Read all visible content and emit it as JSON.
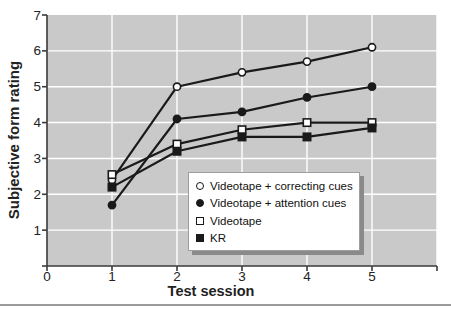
{
  "chart_data": {
    "type": "line",
    "title": "",
    "xlabel": "Test session",
    "ylabel": "Subjective form rating",
    "x": [
      1,
      2,
      3,
      4,
      5
    ],
    "xlim": [
      0,
      6
    ],
    "ylim": [
      0,
      7
    ],
    "x_ticks": [
      0,
      1,
      2,
      3,
      4,
      5
    ],
    "y_ticks": [
      1,
      2,
      3,
      4,
      5,
      6,
      7
    ],
    "grid": true,
    "legend_position": "inside-bottom-right",
    "plot_bg_color": "#c9c9c9",
    "gridline_color": "#ffffff",
    "line_color": "#1a1a1a",
    "axis_color": "#3a3a3a",
    "tick_label_color": "#222222",
    "legend_shadow_color": "#8a8a8a",
    "series": [
      {
        "name": "Videotape + correcting cues",
        "marker": "open-circle",
        "values": [
          2.4,
          5.0,
          5.4,
          5.7,
          6.1
        ]
      },
      {
        "name": "Videotape + attention cues",
        "marker": "filled-circle",
        "values": [
          1.7,
          4.1,
          4.3,
          4.7,
          5.0
        ]
      },
      {
        "name": "Videotape",
        "marker": "open-square",
        "values": [
          2.55,
          3.4,
          3.8,
          4.0,
          4.0
        ]
      },
      {
        "name": "KR",
        "marker": "filled-square",
        "values": [
          2.2,
          3.2,
          3.6,
          3.6,
          3.85
        ]
      }
    ]
  }
}
